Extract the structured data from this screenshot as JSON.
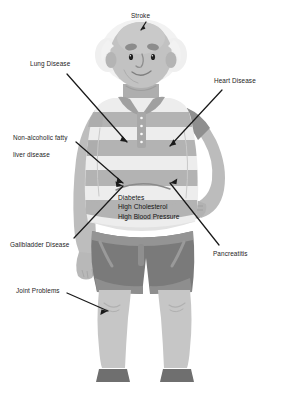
{
  "diagram": {
    "background_color": "#ffffff",
    "text_color": "#1c1c1c"
  },
  "labels": {
    "stroke": "Stroke",
    "lung_disease": "Lung Disease",
    "heart_disease": "Heart Disease",
    "nafld_line1": "Non-alcoholic fatty",
    "nafld_line2": "liver disease",
    "gallbladder": "Gallbladder Disease",
    "pancreatitis": "Pancreatitis",
    "joint_problems": "Joint Problems"
  },
  "central_callout": {
    "line1": "Diabetes",
    "line2": "High Cholesterol",
    "line3": "High Blood Pressure"
  },
  "figure_colors": {
    "skin": "#bdbdbd",
    "skin_shadow": "#a8a8a8",
    "hair": "#f0f0f0",
    "shirt_light": "#ececec",
    "shirt_stripe": "#b3b3b3",
    "shorts": "#7a7a7a",
    "shorts_trim": "#9a9a9a",
    "legs": "#c6c6c6",
    "shoes": "#6f6f6f",
    "outline": "#8f8f8f",
    "arrow": "#1a1a1a"
  }
}
